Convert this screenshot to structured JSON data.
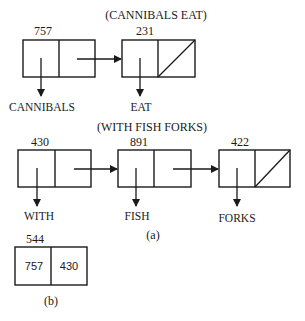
{
  "figure_a": {
    "list1": {
      "title": "(CANNIBALS EAT)",
      "cells": [
        {
          "address": "757",
          "car_label": "CANNIBALS",
          "cdr": "pointer"
        },
        {
          "address": "231",
          "car_label": "EAT",
          "cdr": "nil"
        }
      ]
    },
    "list2": {
      "title": "(WITH FISH FORKS)",
      "cells": [
        {
          "address": "430",
          "car_label": "WITH",
          "cdr": "pointer"
        },
        {
          "address": "891",
          "car_label": "FISH",
          "cdr": "pointer"
        },
        {
          "address": "422",
          "car_label": "FORKS",
          "cdr": "nil"
        }
      ]
    },
    "caption": "(a)"
  },
  "figure_b": {
    "address": "544",
    "car_value": "757",
    "cdr_value": "430",
    "caption": "(b)"
  },
  "colors": {
    "ink": "#1a1a1a",
    "background": "#ffffff"
  }
}
